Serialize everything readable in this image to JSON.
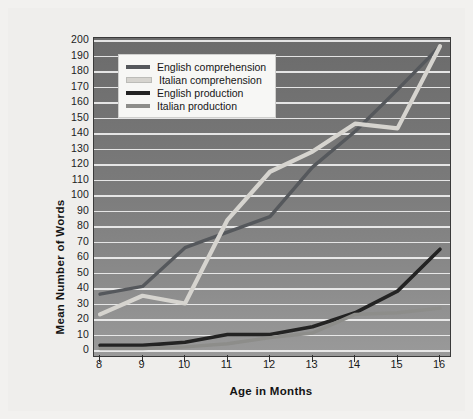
{
  "chart_data": {
    "type": "line",
    "title": "",
    "xlabel": "Age in Months",
    "ylabel": "Mean Number of Words",
    "x": [
      8,
      9,
      10,
      11,
      12,
      13,
      14,
      15,
      16
    ],
    "xlim": [
      8,
      16
    ],
    "ylim": [
      0,
      200
    ],
    "ytick_step": 10,
    "grid": true,
    "legend_position": "top-left",
    "series": [
      {
        "name": "English comprehension",
        "color": "#55585c",
        "values": [
          36,
          41,
          66,
          76,
          86,
          118,
          141,
          168,
          196
        ]
      },
      {
        "name": "Italian comprehension",
        "color": "#d6d4cf",
        "values": [
          23,
          35,
          30,
          84,
          115,
          128,
          146,
          143,
          196
        ]
      },
      {
        "name": "English production",
        "color": "#232323",
        "values": [
          3,
          3,
          5,
          10,
          10,
          15,
          24,
          38,
          65
        ]
      },
      {
        "name": "Italian production",
        "color": "#8d8d8a",
        "values": [
          1,
          1,
          2,
          4,
          8,
          11,
          23,
          24,
          27
        ]
      }
    ],
    "ytick_labels": [
      "200",
      "190",
      "180",
      "170",
      "160",
      "150",
      "140",
      "130",
      "120",
      "110",
      "100",
      "90",
      "80",
      "70",
      "60",
      "50",
      "40",
      "30",
      "20",
      "10",
      "0"
    ],
    "xtick_labels": [
      "8",
      "9",
      "10",
      "11",
      "12",
      "13",
      "14",
      "15",
      "16"
    ]
  },
  "legend": {
    "entries": [
      {
        "label": "English comprehension",
        "color": "#55585c"
      },
      {
        "label": "Italian comprehension",
        "color": "#d6d4cf"
      },
      {
        "label": "English production",
        "color": "#232323"
      },
      {
        "label": "Italian production",
        "color": "#8d8d8a"
      }
    ]
  },
  "axes": {
    "x_title": "Age in Months",
    "y_title": "Mean Number of Words"
  },
  "colors": {
    "plot_background_top": "#6b6b6b",
    "plot_background_bottom": "#9a9a9a",
    "gridline": "#efefef",
    "page_background": "#efeeec",
    "frame_border": "#3a3a3a"
  }
}
